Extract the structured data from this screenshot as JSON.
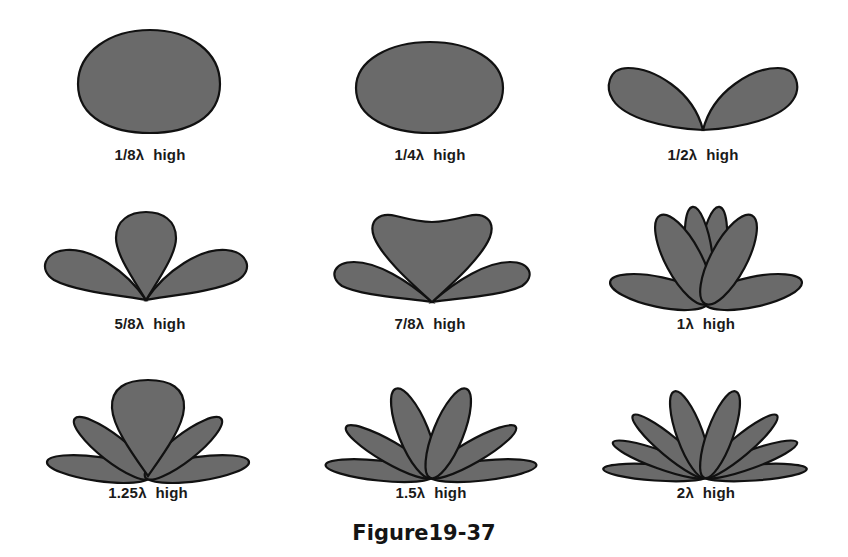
{
  "figure": {
    "caption": "Figure19-37",
    "fill_color": "#6a6a6a",
    "outline_color": "#111111"
  },
  "patterns": [
    {
      "label": "1/8λ  high",
      "height": "1/8λ",
      "lobes": 1
    },
    {
      "label": "1/4λ  high",
      "height": "1/4λ",
      "lobes": 1
    },
    {
      "label": "1/2λ  high",
      "height": "1/2λ",
      "lobes": 2
    },
    {
      "label": "5/8λ  high",
      "height": "5/8λ",
      "lobes": 3
    },
    {
      "label": "7/8λ  high",
      "height": "7/8λ",
      "lobes": 3
    },
    {
      "label": "1λ  high",
      "height": "1λ",
      "lobes": 4
    },
    {
      "label": "1.25λ  high",
      "height": "1.25λ",
      "lobes": 5
    },
    {
      "label": "1.5λ  high",
      "height": "1.5λ",
      "lobes": 6
    },
    {
      "label": "2λ  high",
      "height": "2λ",
      "lobes": 8
    }
  ]
}
